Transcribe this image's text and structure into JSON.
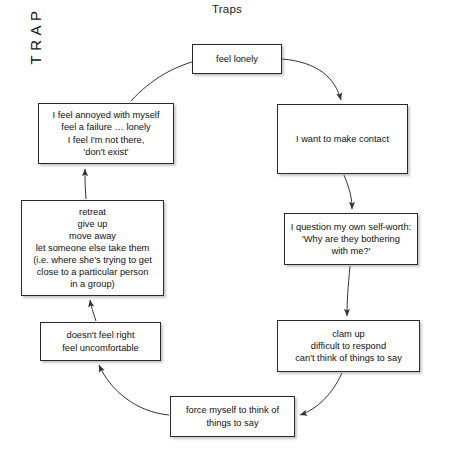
{
  "title": "Traps",
  "center_label": "TRAP",
  "nodes": {
    "feel_lonely": "feel lonely",
    "make_contact": "I want to make contact",
    "self_worth": "I question my own self-worth:\n'Why are they bothering\nwith me?'",
    "clam_up": "clam up\ndifficult to respond\ncan't think of things to say",
    "force_myself": "force myself to think of\nthings to say",
    "doesnt_feel_right": "doesn't feel right\nfeel uncomfortable",
    "retreat": "retreat\ngive up\nmove away\nlet someone else take them\n(i.e. where she's trying to get\nclose to a particular person\nin a group)",
    "annoyed": "I feel annoyed with myself\nfeel a failure …  lonely\nI feel I'm not there,\n'don't exist'"
  },
  "colors": {
    "background": "#ffffff",
    "node_border": "#2a2a2a",
    "node_fill": "#ffffff",
    "text": "#111111",
    "arrow": "#333333"
  },
  "flow": {
    "direction": "clockwise",
    "edges": [
      {
        "from": "feel_lonely",
        "to": "make_contact"
      },
      {
        "from": "make_contact",
        "to": "self_worth"
      },
      {
        "from": "self_worth",
        "to": "clam_up"
      },
      {
        "from": "clam_up",
        "to": "force_myself"
      },
      {
        "from": "force_myself",
        "to": "doesnt_feel_right"
      },
      {
        "from": "doesnt_feel_right",
        "to": "retreat"
      },
      {
        "from": "retreat",
        "to": "annoyed"
      },
      {
        "from": "annoyed",
        "to": "feel_lonely"
      }
    ]
  }
}
